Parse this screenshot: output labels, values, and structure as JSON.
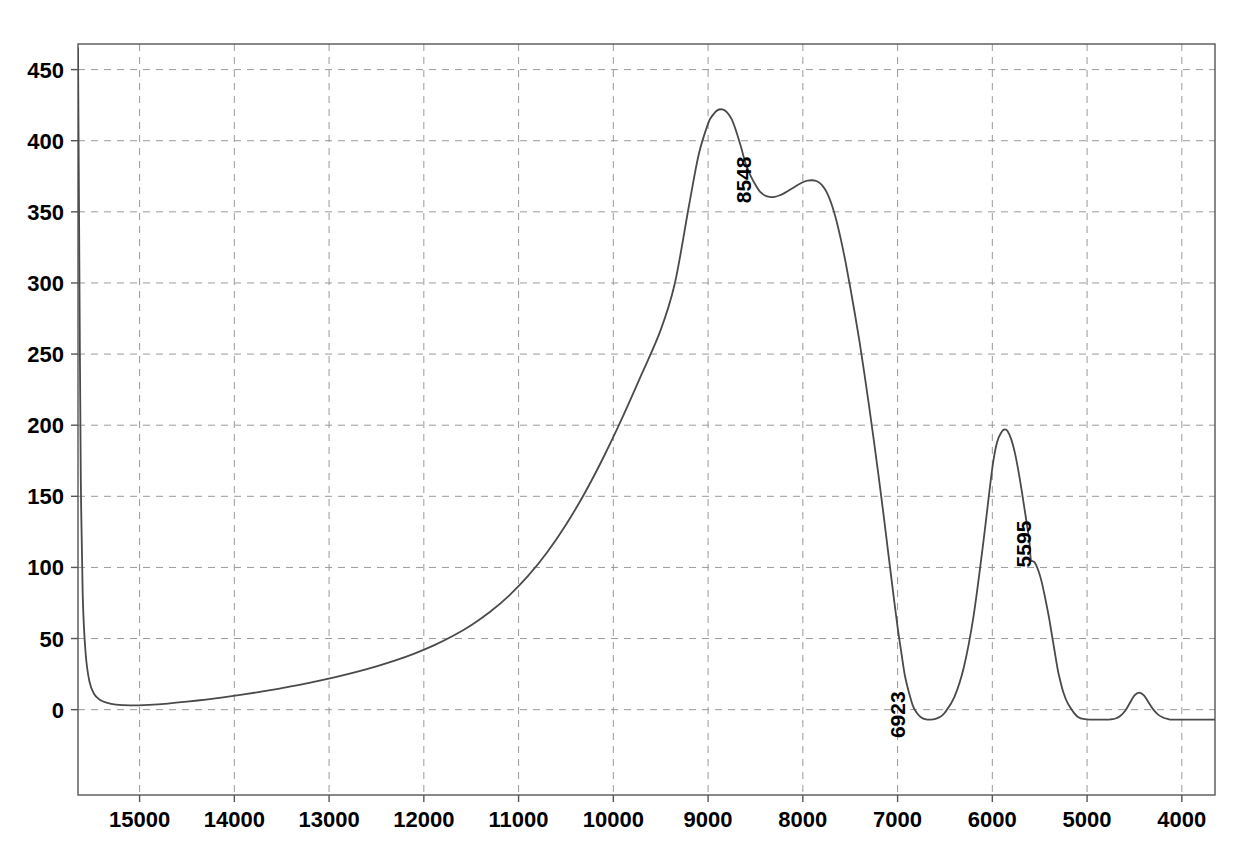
{
  "chart_data": {
    "type": "line",
    "title": "",
    "subtitle": "",
    "xlabel": "",
    "ylabel": "",
    "xlim": [
      15650,
      3650
    ],
    "ylim": [
      -60,
      468
    ],
    "x_reversed": true,
    "grid": true,
    "legend": null,
    "x_ticks": [
      15000,
      14000,
      13000,
      12000,
      11000,
      10000,
      9000,
      8000,
      7000,
      6000,
      5000,
      4000
    ],
    "x_tick_labels": [
      "15000",
      "14000",
      "13000",
      "12000",
      "11000",
      "10000",
      "9000",
      "8000",
      "7000",
      "6000",
      "5000",
      "4000"
    ],
    "y_ticks": [
      0,
      50,
      100,
      150,
      200,
      250,
      300,
      350,
      400,
      450
    ],
    "y_tick_labels": [
      "0",
      "50",
      "100",
      "150",
      "200",
      "250",
      "300",
      "350",
      "400",
      "450"
    ],
    "series": [
      {
        "name": "spectrum",
        "color": "#4a4a4a",
        "x": [
          15650,
          15640,
          15630,
          15620,
          15600,
          15570,
          15530,
          15480,
          15420,
          15350,
          15250,
          15100,
          14900,
          14700,
          14500,
          14300,
          14100,
          13900,
          13700,
          13500,
          13300,
          13100,
          12900,
          12700,
          12500,
          12300,
          12100,
          11900,
          11700,
          11500,
          11300,
          11100,
          10900,
          10700,
          10500,
          10300,
          10100,
          9900,
          9700,
          9500,
          9350,
          9200,
          9100,
          9000,
          8950,
          8900,
          8850,
          8800,
          8750,
          8700,
          8650,
          8600,
          8548,
          8500,
          8450,
          8400,
          8350,
          8300,
          8250,
          8200,
          8150,
          8100,
          8050,
          8000,
          7950,
          7900,
          7850,
          7800,
          7750,
          7700,
          7650,
          7600,
          7550,
          7500,
          7450,
          7400,
          7350,
          7300,
          7250,
          7200,
          7150,
          7100,
          7050,
          7000,
          6960,
          6923,
          6880,
          6840,
          6800,
          6750,
          6700,
          6650,
          6600,
          6550,
          6500,
          6400,
          6300,
          6200,
          6100,
          6000,
          5950,
          5900,
          5870,
          5840,
          5800,
          5760,
          5720,
          5690,
          5660,
          5630,
          5610,
          5595,
          5580,
          5560,
          5540,
          5510,
          5480,
          5450,
          5420,
          5400,
          5380,
          5360,
          5340,
          5320,
          5300,
          5250,
          5200,
          5100,
          5000,
          4900,
          4850,
          4800,
          4750,
          4700,
          4650,
          4600,
          4550,
          4500,
          4450,
          4400,
          4350,
          4300,
          4250,
          4200,
          4150,
          4100,
          4000,
          3900,
          3800,
          3700,
          3650
        ],
        "y": [
          465,
          360,
          250,
          160,
          80,
          40,
          20,
          11,
          7,
          5,
          3.6,
          3.0,
          3.4,
          4.3,
          5.6,
          7.1,
          8.8,
          10.7,
          12.8,
          15.1,
          17.6,
          20.4,
          23.4,
          26.7,
          30.4,
          34.6,
          39.4,
          45.0,
          51.6,
          59.4,
          68.8,
          80.2,
          94.0,
          110.5,
          130.0,
          152.5,
          178.0,
          206.0,
          236.0,
          267.0,
          300.0,
          355.0,
          390.0,
          412.0,
          418.0,
          421.5,
          422.0,
          420.0,
          415.0,
          406.0,
          395.0,
          383.0,
          375.0,
          369.0,
          364.0,
          361.5,
          360.5,
          360.5,
          361.5,
          363.0,
          365.0,
          367.0,
          369.0,
          370.8,
          371.9,
          372.2,
          371.5,
          369.0,
          364.0,
          356.0,
          345.0,
          331.0,
          315.0,
          297.0,
          278.0,
          258.0,
          236.0,
          213.0,
          189.0,
          164.0,
          138.0,
          111.0,
          84.0,
          58.0,
          40.0,
          24.0,
          12.0,
          3.0,
          -2.0,
          -5.5,
          -6.8,
          -7.0,
          -6.5,
          -5.0,
          -2.0,
          9.0,
          30.0,
          65.0,
          115.0,
          170.0,
          188.0,
          195.5,
          197.0,
          196.0,
          190.0,
          180.0,
          166.0,
          154.0,
          141.0,
          128.0,
          119.0,
          106.0,
          104.5,
          104.0,
          102.0,
          97.0,
          90.0,
          81.0,
          71.0,
          64.0,
          56.0,
          48.0,
          40.0,
          32.0,
          25.0,
          12.0,
          4.0,
          -5.0,
          -6.8,
          -7.0,
          -7.0,
          -7.0,
          -6.8,
          -6.2,
          -4.5,
          -1.0,
          4.5,
          10.0,
          12.0,
          10.0,
          5.0,
          0.0,
          -3.5,
          -5.5,
          -6.5,
          -7.0,
          -7.0,
          -7.0,
          -7.0,
          -7.0,
          -7.0
        ]
      }
    ],
    "annotations": [
      {
        "label": "8548",
        "x": 8548,
        "y": 356,
        "rotation": -90,
        "name": "peak-label-8548"
      },
      {
        "label": "6923",
        "x": 6923,
        "y": -20,
        "rotation": -90,
        "name": "peak-label-6923"
      },
      {
        "label": "5595",
        "x": 5595,
        "y": 100,
        "rotation": -90,
        "name": "peak-label-5595"
      }
    ],
    "colors": {
      "curve": "#4a4a4a",
      "grid": "#9a9a9a",
      "frame": "#555555",
      "text": "#000000",
      "background": "#ffffff"
    }
  }
}
